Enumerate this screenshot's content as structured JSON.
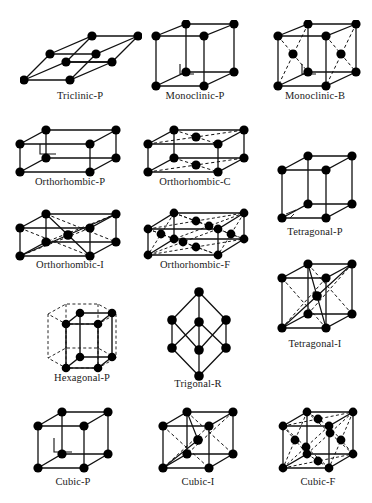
{
  "figure": {
    "background_color": "#ffffff",
    "line_color": "#111111",
    "node_color": "#000000",
    "caption_color": "#1a1a1a"
  },
  "lattices": [
    {
      "id": "triclinic-p",
      "label": "Triclinic-P",
      "system": "triclinic",
      "centering": "P",
      "lattice_points": 8,
      "style": "solid-edges",
      "right_angle_marker": false,
      "box": {
        "x": 20,
        "y": 28,
        "w": 120,
        "h": 62
      },
      "caption": {
        "x": 20,
        "y": 90,
        "w": 120
      }
    },
    {
      "id": "monoclinic-p",
      "label": "Monoclinic-P",
      "system": "monoclinic",
      "centering": "P",
      "lattice_points": 8,
      "style": "solid-edges",
      "right_angle_marker": true,
      "box": {
        "x": 143,
        "y": 20,
        "w": 104,
        "h": 72
      },
      "caption": {
        "x": 135,
        "y": 90,
        "w": 120
      }
    },
    {
      "id": "monoclinic-b",
      "label": "Monoclinic-B",
      "system": "monoclinic",
      "centering": "B",
      "lattice_points": 10,
      "style": "solid-and-dashed",
      "right_angle_marker": true,
      "box": {
        "x": 265,
        "y": 20,
        "w": 104,
        "h": 72
      },
      "caption": {
        "x": 255,
        "y": 90,
        "w": 120
      }
    },
    {
      "id": "orthorhombic-p",
      "label": "Orthorhombic-P",
      "system": "orthorhombic",
      "centering": "P",
      "lattice_points": 8,
      "style": "solid-edges",
      "right_angle_marker": true,
      "box": {
        "x": 10,
        "y": 124,
        "w": 114,
        "h": 54
      },
      "caption": {
        "x": 8,
        "y": 176,
        "w": 124
      }
    },
    {
      "id": "orthorhombic-c",
      "label": "Orthorhombic-C",
      "system": "orthorhombic",
      "centering": "C",
      "lattice_points": 10,
      "style": "solid-and-dashed",
      "right_angle_marker": false,
      "box": {
        "x": 138,
        "y": 124,
        "w": 114,
        "h": 54
      },
      "caption": {
        "x": 133,
        "y": 176,
        "w": 124
      }
    },
    {
      "id": "tetragonal-p",
      "label": "Tetragonal-P",
      "system": "tetragonal",
      "centering": "P",
      "lattice_points": 8,
      "style": "solid-edges",
      "right_angle_marker": false,
      "box": {
        "x": 272,
        "y": 150,
        "w": 86,
        "h": 78
      },
      "caption": {
        "x": 255,
        "y": 226,
        "w": 120
      }
    },
    {
      "id": "orthorhombic-i",
      "label": "Orthorhombic-I",
      "system": "orthorhombic",
      "centering": "I",
      "lattice_points": 9,
      "style": "solid-and-dashed",
      "right_angle_marker": false,
      "box": {
        "x": 10,
        "y": 208,
        "w": 114,
        "h": 54
      },
      "caption": {
        "x": 8,
        "y": 259,
        "w": 124
      }
    },
    {
      "id": "orthorhombic-f",
      "label": "Orthorhombic-F",
      "system": "orthorhombic",
      "centering": "F",
      "lattice_points": 14,
      "style": "solid-and-dashed",
      "right_angle_marker": false,
      "box": {
        "x": 138,
        "y": 205,
        "w": 118,
        "h": 58
      },
      "caption": {
        "x": 133,
        "y": 259,
        "w": 124
      }
    },
    {
      "id": "hexagonal-p",
      "label": "Hexagonal-P",
      "system": "hexagonal",
      "centering": "P",
      "lattice_points": 8,
      "style": "solid-with-dashed-hexagon",
      "right_angle_marker": false,
      "box": {
        "x": 38,
        "y": 294,
        "w": 88,
        "h": 80
      },
      "caption": {
        "x": 22,
        "y": 372,
        "w": 120
      }
    },
    {
      "id": "trigonal-r",
      "label": "Trigonal-R",
      "system": "trigonal",
      "centering": "R",
      "lattice_points": 8,
      "style": "solid-edges",
      "right_angle_marker": false,
      "box": {
        "x": 160,
        "y": 286,
        "w": 76,
        "h": 94
      },
      "caption": {
        "x": 138,
        "y": 378,
        "w": 120
      }
    },
    {
      "id": "tetragonal-i",
      "label": "Tetragonal-I",
      "system": "tetragonal",
      "centering": "I",
      "lattice_points": 9,
      "style": "solid-and-dashed",
      "right_angle_marker": false,
      "box": {
        "x": 272,
        "y": 258,
        "w": 86,
        "h": 82
      },
      "caption": {
        "x": 255,
        "y": 338,
        "w": 120
      }
    },
    {
      "id": "cubic-p",
      "label": "Cubic-P",
      "system": "cubic",
      "centering": "P",
      "lattice_points": 8,
      "style": "solid-edges",
      "right_angle_marker": true,
      "box": {
        "x": 30,
        "y": 404,
        "w": 86,
        "h": 76
      },
      "caption": {
        "x": 18,
        "y": 476,
        "w": 110
      }
    },
    {
      "id": "cubic-i",
      "label": "Cubic-I",
      "system": "cubic",
      "centering": "I",
      "lattice_points": 9,
      "style": "solid-and-dashed",
      "right_angle_marker": false,
      "box": {
        "x": 155,
        "y": 404,
        "w": 86,
        "h": 76
      },
      "caption": {
        "x": 143,
        "y": 476,
        "w": 110
      }
    },
    {
      "id": "cubic-f",
      "label": "Cubic-F",
      "system": "cubic",
      "centering": "F",
      "lattice_points": 14,
      "style": "solid-and-dashed",
      "right_angle_marker": false,
      "box": {
        "x": 275,
        "y": 404,
        "w": 86,
        "h": 76
      },
      "caption": {
        "x": 263,
        "y": 476,
        "w": 110
      }
    }
  ]
}
